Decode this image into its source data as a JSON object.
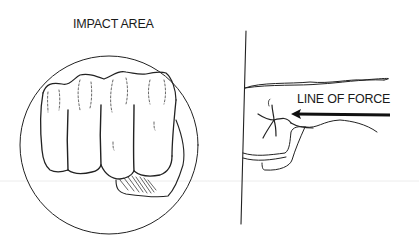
{
  "figure": {
    "left_panel": {
      "label": "IMPACT AREA",
      "subject": "front view of clenched fist inside circle"
    },
    "right_panel": {
      "label": "LINE OF FORCE",
      "subject": "side view of fist striking vertical surface",
      "arrow_direction": "left"
    },
    "colors": {
      "ink": "#1a1a1a",
      "background": "#ffffff",
      "separator": "#e8e8e8"
    }
  }
}
